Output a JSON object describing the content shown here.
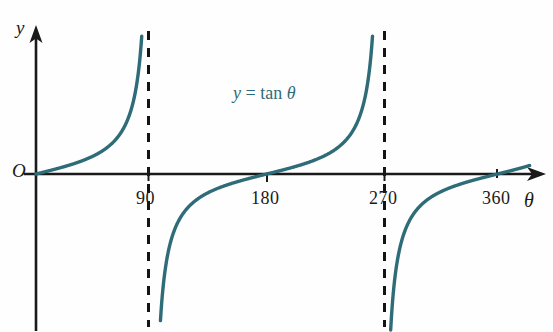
{
  "figure": {
    "width": 553,
    "height": 332,
    "background": "#fefefe"
  },
  "labels": {
    "y_axis": "y",
    "x_axis": "θ",
    "origin": "O",
    "equation_lhs": "y",
    "equation_eq": "=",
    "equation_fn": "tan",
    "equation_arg": "θ",
    "equation_full": "y = tan θ"
  },
  "colors": {
    "curve": "#2e6c78",
    "axis": "#1a1a1a",
    "asymptote": "#141414",
    "equation_text": "#2e6c78",
    "background": "#fefefe"
  },
  "chart_data": {
    "type": "line",
    "xlabel": "θ",
    "ylabel": "y",
    "xlim": [
      0,
      385
    ],
    "ylim": [
      -7.5,
      7.5
    ],
    "grid": false,
    "legend": null,
    "function": "y = tan(theta)",
    "angle_unit": "degrees",
    "xticks": [
      90,
      180,
      270,
      360
    ],
    "xtick_labels": [
      "90",
      "180",
      "270",
      "360"
    ],
    "yticks": [],
    "ytick_labels": [],
    "asymptotes": [
      90,
      270
    ],
    "zeros": [
      0,
      180,
      360
    ],
    "origin_label": "O",
    "annotations": [
      {
        "text": "y = tan θ",
        "x": 150,
        "y": 5.4,
        "color": "#2e6c78"
      }
    ],
    "series": [
      {
        "name": "branch-1",
        "domain": [
          0,
          90
        ],
        "x": [
          0,
          10,
          20,
          30,
          40,
          50,
          60,
          65,
          70,
          75,
          78,
          80,
          82,
          83
        ],
        "values": [
          0,
          0.176,
          0.364,
          0.577,
          0.839,
          1.192,
          1.732,
          2.145,
          2.747,
          3.732,
          4.705,
          5.671,
          7.115,
          8.144
        ]
      },
      {
        "name": "branch-2",
        "domain": [
          90,
          270
        ],
        "x": [
          97,
          99,
          101,
          104,
          108,
          115,
          125,
          140,
          160,
          180,
          200,
          220,
          235,
          245,
          252,
          256,
          259,
          261,
          263
        ],
        "values": [
          -8.144,
          -6.314,
          -5.145,
          -4.011,
          -3.078,
          -2.145,
          -1.428,
          -0.839,
          -0.364,
          0,
          0.364,
          0.839,
          1.428,
          2.145,
          3.078,
          4.011,
          5.145,
          6.314,
          8.144
        ]
      },
      {
        "name": "branch-3",
        "domain": [
          270,
          385
        ],
        "x": [
          277,
          280,
          285,
          292,
          300,
          312,
          325,
          340,
          360,
          375,
          383
        ],
        "values": [
          -8.144,
          -5.671,
          -3.732,
          -2.475,
          -1.732,
          -1.15,
          -0.7,
          -0.364,
          0,
          0.268,
          0.414
        ]
      }
    ]
  },
  "positions": {
    "x_axis_y": 174,
    "y_axis_x": 36,
    "px_per_degree": 1.282,
    "x_origin_px": 36,
    "asymptote_90_px": 148,
    "asymptote_270_px": 384,
    "tick_180_px": 267,
    "tick_360_px": 497
  }
}
